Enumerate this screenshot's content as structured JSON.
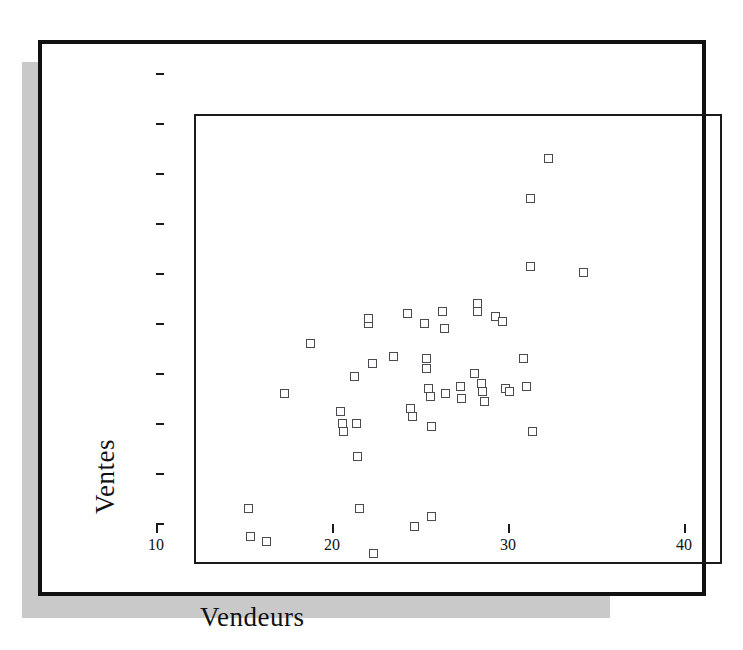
{
  "figure": {
    "frame_color": "#111111",
    "shadow_color": "#c9c9c9",
    "marker_color": "#4a4a52"
  },
  "chart_data": {
    "type": "scatter",
    "title": "",
    "xlabel": "Vendeurs",
    "ylabel": "Ventes",
    "xlim": [
      10,
      40
    ],
    "ylim": [
      80000,
      260000
    ],
    "xticks": [
      10,
      20,
      30,
      40
    ],
    "yticks": [
      80000,
      100000,
      120000,
      140000,
      160000,
      180000,
      200000,
      220000,
      240000,
      260000
    ],
    "xtick_labels": [
      "10",
      "20",
      "30",
      "40"
    ],
    "ytick_labels": [
      "80000",
      "100000",
      "120000",
      "140000",
      "160000",
      "180000",
      "200000",
      "220000",
      "240000",
      "260000"
    ],
    "grid": false,
    "legend": null,
    "marker": "open-square",
    "points": [
      {
        "x": 13.0,
        "y": 103000
      },
      {
        "x": 13.1,
        "y": 92000
      },
      {
        "x": 14.0,
        "y": 90000
      },
      {
        "x": 15.0,
        "y": 149000
      },
      {
        "x": 16.5,
        "y": 169000
      },
      {
        "x": 18.2,
        "y": 142000
      },
      {
        "x": 18.3,
        "y": 137000
      },
      {
        "x": 18.4,
        "y": 134000
      },
      {
        "x": 19.0,
        "y": 156000
      },
      {
        "x": 19.1,
        "y": 137000
      },
      {
        "x": 19.2,
        "y": 124000
      },
      {
        "x": 19.3,
        "y": 103000
      },
      {
        "x": 19.8,
        "y": 177000
      },
      {
        "x": 19.8,
        "y": 179000
      },
      {
        "x": 20.0,
        "y": 161000
      },
      {
        "x": 20.1,
        "y": 85000
      },
      {
        "x": 21.2,
        "y": 164000
      },
      {
        "x": 22.0,
        "y": 181000
      },
      {
        "x": 22.2,
        "y": 143000
      },
      {
        "x": 22.3,
        "y": 140000
      },
      {
        "x": 22.4,
        "y": 96000
      },
      {
        "x": 23.0,
        "y": 177000
      },
      {
        "x": 23.1,
        "y": 163000
      },
      {
        "x": 23.1,
        "y": 159000
      },
      {
        "x": 23.2,
        "y": 151000
      },
      {
        "x": 23.3,
        "y": 148000
      },
      {
        "x": 23.4,
        "y": 136000
      },
      {
        "x": 23.4,
        "y": 100000
      },
      {
        "x": 24.0,
        "y": 182000
      },
      {
        "x": 24.1,
        "y": 175000
      },
      {
        "x": 24.2,
        "y": 149000
      },
      {
        "x": 25.0,
        "y": 152000
      },
      {
        "x": 25.1,
        "y": 147000
      },
      {
        "x": 25.8,
        "y": 157000
      },
      {
        "x": 26.0,
        "y": 185000
      },
      {
        "x": 26.0,
        "y": 182000
      },
      {
        "x": 26.2,
        "y": 153000
      },
      {
        "x": 26.3,
        "y": 150000
      },
      {
        "x": 26.4,
        "y": 146000
      },
      {
        "x": 27.0,
        "y": 180000
      },
      {
        "x": 27.4,
        "y": 178000
      },
      {
        "x": 27.6,
        "y": 151000
      },
      {
        "x": 27.8,
        "y": 150000
      },
      {
        "x": 28.6,
        "y": 163000
      },
      {
        "x": 28.8,
        "y": 152000
      },
      {
        "x": 29.0,
        "y": 200000
      },
      {
        "x": 29.0,
        "y": 227000
      },
      {
        "x": 29.1,
        "y": 134000
      },
      {
        "x": 30.0,
        "y": 243000
      },
      {
        "x": 32.0,
        "y": 197500
      }
    ]
  }
}
